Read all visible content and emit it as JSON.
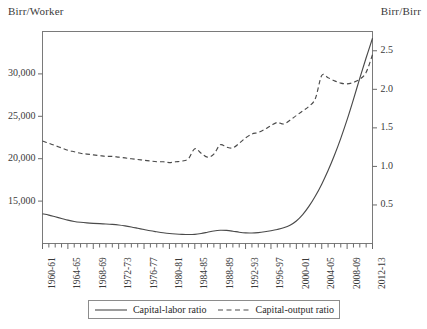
{
  "axis_units": {
    "left": "Birr/Worker",
    "right": "Birr/Birr"
  },
  "legend": {
    "entries": [
      {
        "label": "Capital-labor ratio",
        "style": "solid"
      },
      {
        "label": "Capital-output ratio",
        "style": "dashed"
      }
    ]
  },
  "chart_data": {
    "type": "line",
    "title": "",
    "xlabel": "",
    "ylabel": "Birr/Worker",
    "y2label": "Birr/Birr",
    "grid": false,
    "legend_position": "bottom",
    "ylim": [
      10000,
      35000
    ],
    "y2lim": [
      0,
      2.75
    ],
    "yticks": [
      15000,
      20000,
      25000,
      30000
    ],
    "ytick_labels": [
      "15,000",
      "20,000",
      "25,000",
      "30,000"
    ],
    "y2ticks": [
      0.5,
      1.0,
      1.5,
      2.0,
      2.5
    ],
    "y2tick_labels": [
      "0.5",
      "1.0",
      "1.5",
      "2.0",
      "2.5"
    ],
    "categories": [
      "1960-61",
      "1961-62",
      "1962-63",
      "1963-64",
      "1964-65",
      "1965-66",
      "1966-67",
      "1967-68",
      "1968-69",
      "1969-70",
      "1970-71",
      "1971-72",
      "1972-73",
      "1973-74",
      "1974-75",
      "1975-76",
      "1976-77",
      "1977-78",
      "1978-79",
      "1979-80",
      "1980-81",
      "1981-82",
      "1982-83",
      "1983-84",
      "1984-85",
      "1985-86",
      "1986-87",
      "1987-88",
      "1988-89",
      "1989-90",
      "1990-91",
      "1991-92",
      "1992-93",
      "1993-94",
      "1994-95",
      "1995-96",
      "1996-97",
      "1997-98",
      "1998-99",
      "1999-00",
      "2000-01",
      "2001-02",
      "2002-03",
      "2003-04",
      "2004-05",
      "2005-06",
      "2006-07",
      "2007-08",
      "2008-09",
      "2009-10",
      "2010-11",
      "2011-12",
      "2012-13"
    ],
    "xtick_labels": [
      "1960-61",
      "1964-65",
      "1968-69",
      "1972-73",
      "1976-77",
      "1980-81",
      "1984-85",
      "1988-89",
      "1992-93",
      "1996-97",
      "2000-01",
      "2004-05",
      "2008-09",
      "2012-13"
    ],
    "xtick_indices": [
      0,
      4,
      8,
      12,
      16,
      20,
      24,
      28,
      32,
      36,
      40,
      44,
      48,
      52
    ],
    "series": [
      {
        "name": "Capital-labor ratio",
        "axis": "left",
        "style": "solid",
        "values": [
          13500,
          13350,
          13150,
          12950,
          12750,
          12600,
          12500,
          12430,
          12380,
          12340,
          12300,
          12250,
          12180,
          12080,
          11950,
          11800,
          11650,
          11500,
          11380,
          11270,
          11180,
          11120,
          11080,
          11060,
          11080,
          11180,
          11330,
          11480,
          11560,
          11540,
          11450,
          11330,
          11250,
          11240,
          11290,
          11380,
          11500,
          11650,
          11850,
          12150,
          12650,
          13400,
          14400,
          15600,
          17000,
          18600,
          20400,
          22400,
          24600,
          27000,
          29500,
          31900,
          34200
        ]
      },
      {
        "name": "Capital-output ratio",
        "axis": "right",
        "style": "dashed",
        "values": [
          1.33,
          1.3,
          1.27,
          1.24,
          1.21,
          1.19,
          1.17,
          1.16,
          1.15,
          1.14,
          1.13,
          1.13,
          1.12,
          1.11,
          1.1,
          1.09,
          1.08,
          1.07,
          1.06,
          1.06,
          1.05,
          1.06,
          1.07,
          1.1,
          1.23,
          1.17,
          1.12,
          1.16,
          1.28,
          1.25,
          1.24,
          1.3,
          1.37,
          1.42,
          1.44,
          1.48,
          1.53,
          1.57,
          1.55,
          1.6,
          1.66,
          1.72,
          1.78,
          1.88,
          2.18,
          2.15,
          2.11,
          2.08,
          2.07,
          2.09,
          2.13,
          2.22,
          2.45
        ]
      }
    ]
  }
}
